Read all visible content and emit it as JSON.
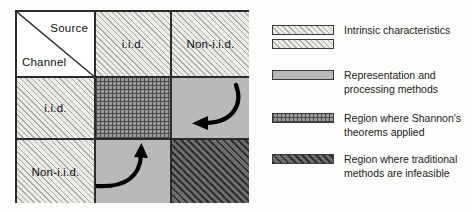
{
  "matrix": {
    "corner": {
      "source_label": "Source",
      "channel_label": "Channel"
    },
    "column_headers": [
      "i.i.d.",
      "Non-i.i.d."
    ],
    "row_headers": [
      "i.i.d.",
      "Non-i.i.d."
    ],
    "cells": [
      {
        "row": "i.i.d.",
        "col": "i.i.d.",
        "fill": "cross-hatch-grid",
        "arrow": "none"
      },
      {
        "row": "i.i.d.",
        "col": "Non-i.i.d.",
        "fill": "solid-gray",
        "arrow": "curved-arrow-left"
      },
      {
        "row": "Non-i.i.d.",
        "col": "i.i.d.",
        "fill": "solid-gray",
        "arrow": "curved-arrow-up"
      },
      {
        "row": "Non-i.i.d.",
        "col": "Non-i.i.d.",
        "fill": "dark-diagonal-hatch",
        "arrow": "none"
      }
    ]
  },
  "legend": {
    "items": [
      {
        "label": "Intrinsic characteristics",
        "swatches": 2,
        "fill": "light-diagonal-hatch"
      },
      {
        "label": "Representation and processing methods",
        "swatches": 1,
        "fill": "solid-gray"
      },
      {
        "label": "Region where Shannon's theorems applied",
        "swatches": 1,
        "fill": "cross-hatch-grid"
      },
      {
        "label": "Region where traditional methods are infeasible",
        "swatches": 1,
        "fill": "dark-diagonal-hatch"
      }
    ]
  },
  "colors": {
    "border": "#2b2b2b",
    "hatch_light_bg": "#ebebe7",
    "solid_gray": "#b9b9b9",
    "grid_bg": "#9a9a9a",
    "hatch_dark_bg": "#6e6e6e",
    "page_bg": "#fdfdfb"
  }
}
